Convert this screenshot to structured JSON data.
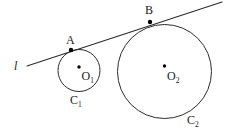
{
  "figure": {
    "canvas": {
      "width": 229,
      "height": 137,
      "background": "#ffffff"
    },
    "stroke_color": "#2b2b2b",
    "point_color": "#000000",
    "label_color": "#1a1a1a",
    "line": {
      "name": "l",
      "label": "l",
      "label_x": 14,
      "label_y": 70,
      "x1": 27,
      "y1": 66,
      "x2": 222,
      "y2": 2,
      "stroke_width": 1.1
    },
    "circles": [
      {
        "id": "C1",
        "label": "C₁",
        "label_text": "C",
        "label_sub": "1",
        "label_x": 70,
        "label_y": 104,
        "cx": 79,
        "cy": 70.5,
        "r": 21,
        "stroke_width": 1.0,
        "center": {
          "name": "O1",
          "label_text": "O",
          "label_sub": "1",
          "dot_x": 79,
          "dot_y": 67,
          "dot_r": 1.7,
          "label_x": 81.5,
          "label_y": 80
        },
        "tangent_point": {
          "name": "A",
          "label": "A",
          "x": 71,
          "y": 50,
          "dot_r": 2.2,
          "label_x": 66,
          "label_y": 44
        }
      },
      {
        "id": "C2",
        "label": "C₂",
        "label_text": "C",
        "label_sub": "2",
        "label_x": 187,
        "label_y": 124,
        "cx": 164.5,
        "cy": 71.5,
        "r": 47,
        "stroke_width": 1.0,
        "center": {
          "name": "O2",
          "label_text": "O",
          "label_sub": "2",
          "dot_x": 164.5,
          "dot_y": 66,
          "dot_r": 1.7,
          "label_x": 167,
          "label_y": 80
        },
        "tangent_point": {
          "name": "B",
          "label": "B",
          "x": 150,
          "y": 22,
          "dot_r": 2.2,
          "label_x": 145,
          "label_y": 14
        }
      }
    ]
  }
}
